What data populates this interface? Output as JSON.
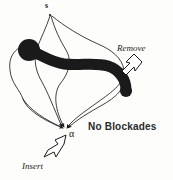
{
  "figure": {
    "background_color": "#fdfdfc",
    "ink_color": "#1a1a1a",
    "thick_path_color": "#1a1a1a",
    "labels": {
      "source": "s",
      "sink": "α",
      "remove": "Remove",
      "insert": "Insert",
      "note": "No Blockades"
    },
    "annotations": [
      {
        "name": "remove-callout",
        "text": "Remove",
        "style": "italic",
        "arrow_direction": "up-left",
        "points_to": "thick-path-right-end"
      },
      {
        "name": "insert-callout",
        "text": "Insert",
        "style": "italic",
        "arrow_direction": "up-right",
        "points_to": "sink-node-alpha"
      },
      {
        "name": "no-blockades-note",
        "text": "No Blockades",
        "style": "upright",
        "arrow_direction": "none",
        "points_to": "none"
      }
    ],
    "nodes": [
      {
        "name": "source-node",
        "label": "s",
        "x": 50,
        "y": 14
      },
      {
        "name": "sink-node",
        "label": "α",
        "x": 66,
        "y": 130
      }
    ],
    "edges": [
      {
        "name": "edge-s-left-outer",
        "from": "s",
        "to": "α",
        "stroke": "thin",
        "arrowhead": true
      },
      {
        "name": "edge-s-right-outer",
        "from": "s",
        "to": "α",
        "stroke": "thin",
        "arrowhead": true
      },
      {
        "name": "edge-far-left-loop",
        "from": "s",
        "to": "α",
        "stroke": "thin",
        "arrowhead": true
      },
      {
        "name": "edge-far-right-loop",
        "from": "s",
        "to": "α",
        "stroke": "thin",
        "arrowhead": true
      },
      {
        "name": "edge-inner-middle",
        "from": "s",
        "to": "α",
        "stroke": "thin",
        "arrowhead": true
      }
    ],
    "thick_path": {
      "name": "augmenting-path",
      "description": "thick black blockade path crossing the network from upper-left blob to lower-right tip",
      "stroke": "thick",
      "blob_head": {
        "x": 29,
        "y": 50,
        "r": 11
      },
      "tail_tip": {
        "x": 126,
        "y": 92
      }
    }
  }
}
